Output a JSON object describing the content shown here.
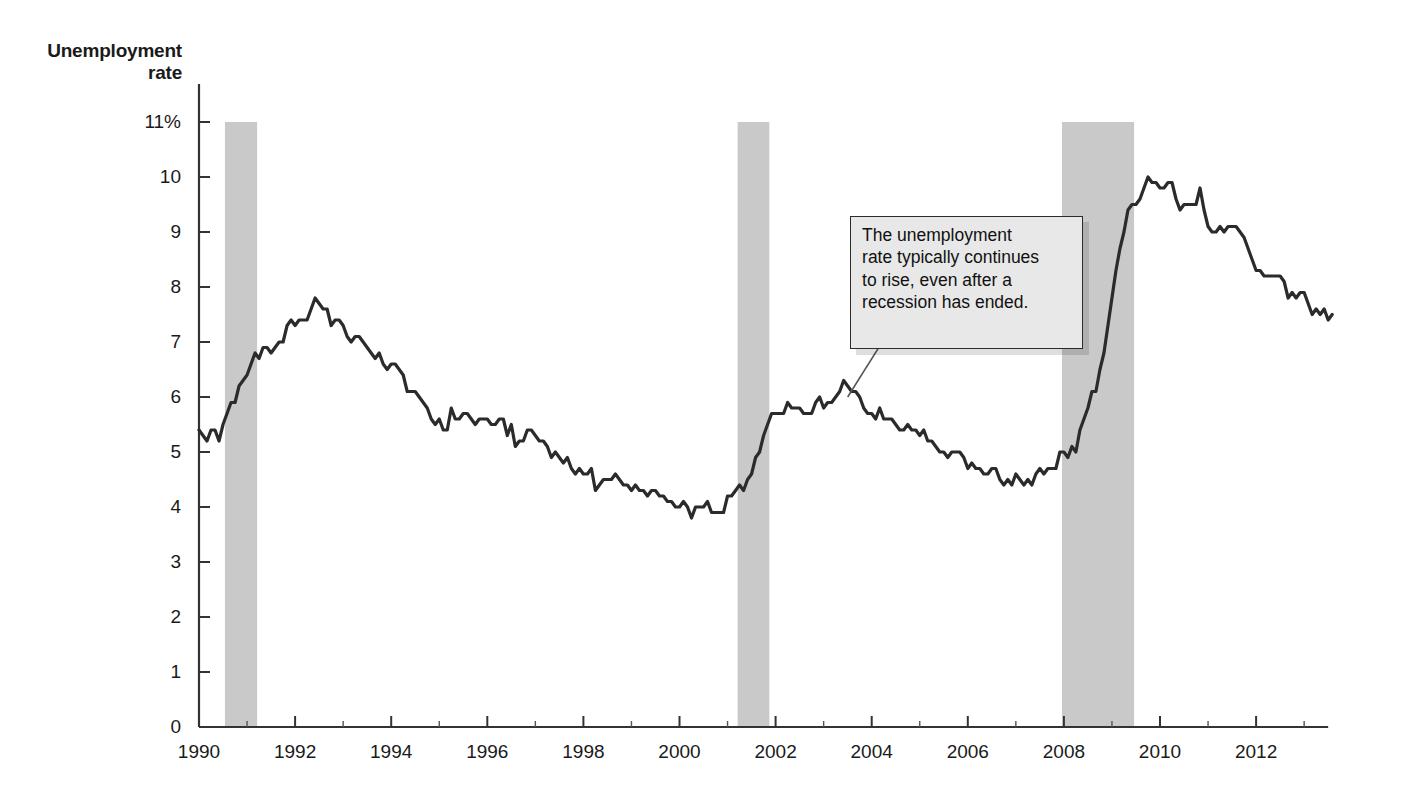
{
  "chart_data": {
    "type": "line",
    "title": "",
    "subtitle": "",
    "xlabel": "",
    "ylabel": "Unemployment\nrate",
    "ylim": [
      0,
      11
    ],
    "xlim": [
      1990,
      2013.5
    ],
    "grid": false,
    "legend_position": "none",
    "y_ticks": [
      "11%",
      "10",
      "9",
      "8",
      "7",
      "6",
      "5",
      "4",
      "3",
      "2",
      "1",
      "0"
    ],
    "y_tick_values": [
      11,
      10,
      9,
      8,
      7,
      6,
      5,
      4,
      3,
      2,
      1,
      0
    ],
    "x_ticks": [
      "1990",
      "1992",
      "1994",
      "1996",
      "1998",
      "2000",
      "2002",
      "2004",
      "2006",
      "2008",
      "2010",
      "2012"
    ],
    "x_tick_values": [
      1990,
      1992,
      1994,
      1996,
      1998,
      2000,
      2002,
      2004,
      2006,
      2008,
      2010,
      2012
    ],
    "x_minor_tick_values": [
      1991,
      1993,
      1995,
      1997,
      1999,
      2001,
      2003,
      2005,
      2007,
      2009,
      2011,
      2013
    ],
    "line_color": "#2b2b2b",
    "line_width": 3.2,
    "recession_color": "#c9c9c9",
    "recession_bands": [
      {
        "label": "1990-91 recession",
        "start": 1990.54,
        "end": 1991.21
      },
      {
        "label": "2001 recession",
        "start": 2001.21,
        "end": 2001.87
      },
      {
        "label": "2007-09 recession",
        "start": 2007.96,
        "end": 2009.46
      }
    ],
    "annotations": [
      {
        "name": "recession-lag-note",
        "text": "The unemployment\nrate typically continues\nto rise, even after a\nrecession has ended.",
        "box_x": 2003.55,
        "box_y": 9.3,
        "box_w": 4.85,
        "box_h": 2.42,
        "pointer_x": 2003.5,
        "pointer_y": 6.0
      }
    ],
    "series": [
      {
        "name": "Unemployment rate",
        "units": "percent",
        "x_start": 1990.0,
        "x_step": 0.0833333,
        "values": [
          5.4,
          5.3,
          5.2,
          5.4,
          5.4,
          5.2,
          5.5,
          5.7,
          5.9,
          5.9,
          6.2,
          6.3,
          6.4,
          6.6,
          6.8,
          6.7,
          6.9,
          6.9,
          6.8,
          6.9,
          7.0,
          7.0,
          7.3,
          7.4,
          7.3,
          7.4,
          7.4,
          7.4,
          7.6,
          7.8,
          7.7,
          7.6,
          7.6,
          7.3,
          7.4,
          7.4,
          7.3,
          7.1,
          7.0,
          7.1,
          7.1,
          7.0,
          6.9,
          6.8,
          6.7,
          6.8,
          6.6,
          6.5,
          6.6,
          6.6,
          6.5,
          6.4,
          6.1,
          6.1,
          6.1,
          6.0,
          5.9,
          5.8,
          5.6,
          5.5,
          5.6,
          5.4,
          5.4,
          5.8,
          5.6,
          5.6,
          5.7,
          5.7,
          5.6,
          5.5,
          5.6,
          5.6,
          5.6,
          5.5,
          5.5,
          5.6,
          5.6,
          5.3,
          5.5,
          5.1,
          5.2,
          5.2,
          5.4,
          5.4,
          5.3,
          5.2,
          5.2,
          5.1,
          4.9,
          5.0,
          4.9,
          4.8,
          4.9,
          4.7,
          4.6,
          4.7,
          4.6,
          4.6,
          4.7,
          4.3,
          4.4,
          4.5,
          4.5,
          4.5,
          4.6,
          4.5,
          4.4,
          4.4,
          4.3,
          4.4,
          4.3,
          4.3,
          4.2,
          4.3,
          4.3,
          4.2,
          4.2,
          4.1,
          4.1,
          4.0,
          4.0,
          4.1,
          4.0,
          3.8,
          4.0,
          4.0,
          4.0,
          4.1,
          3.9,
          3.9,
          3.9,
          3.9,
          4.2,
          4.2,
          4.3,
          4.4,
          4.3,
          4.5,
          4.6,
          4.9,
          5.0,
          5.3,
          5.5,
          5.7,
          5.7,
          5.7,
          5.7,
          5.9,
          5.8,
          5.8,
          5.8,
          5.7,
          5.7,
          5.7,
          5.9,
          6.0,
          5.8,
          5.9,
          5.9,
          6.0,
          6.1,
          6.3,
          6.2,
          6.1,
          6.1,
          6.0,
          5.8,
          5.7,
          5.7,
          5.6,
          5.8,
          5.6,
          5.6,
          5.6,
          5.5,
          5.4,
          5.4,
          5.5,
          5.4,
          5.4,
          5.3,
          5.4,
          5.2,
          5.2,
          5.1,
          5.0,
          5.0,
          4.9,
          5.0,
          5.0,
          5.0,
          4.9,
          4.7,
          4.8,
          4.7,
          4.7,
          4.6,
          4.6,
          4.7,
          4.7,
          4.5,
          4.4,
          4.5,
          4.4,
          4.6,
          4.5,
          4.4,
          4.5,
          4.4,
          4.6,
          4.7,
          4.6,
          4.7,
          4.7,
          4.7,
          5.0,
          5.0,
          4.9,
          5.1,
          5.0,
          5.4,
          5.6,
          5.8,
          6.1,
          6.1,
          6.5,
          6.8,
          7.3,
          7.8,
          8.3,
          8.7,
          9.0,
          9.4,
          9.5,
          9.5,
          9.6,
          9.8,
          10.0,
          9.9,
          9.9,
          9.8,
          9.8,
          9.9,
          9.9,
          9.6,
          9.4,
          9.5,
          9.5,
          9.5,
          9.5,
          9.8,
          9.4,
          9.1,
          9.0,
          9.0,
          9.1,
          9.0,
          9.1,
          9.1,
          9.1,
          9.0,
          8.9,
          8.7,
          8.5,
          8.3,
          8.3,
          8.2,
          8.2,
          8.2,
          8.2,
          8.2,
          8.1,
          7.8,
          7.9,
          7.8,
          7.9,
          7.9,
          7.7,
          7.5,
          7.6,
          7.5,
          7.6,
          7.4,
          7.5
        ]
      }
    ]
  }
}
